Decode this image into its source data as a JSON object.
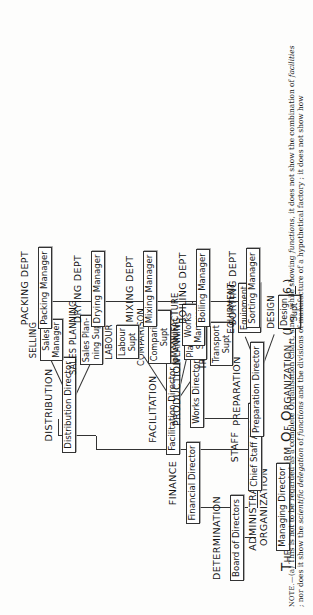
{
  "figure": {
    "title_main": "The Functional Form of Organization.",
    "title_ref": "(Figure 6.)"
  },
  "nodes": {
    "determination": {
      "function": "Determination",
      "role": "Board of Directors"
    },
    "administration": {
      "function": "Administration Organization",
      "function_line1": "Administration",
      "function_line2": "Organization",
      "role": "Managing Director"
    },
    "finance": {
      "function": "Finance",
      "role": "Financial Director"
    },
    "staff": {
      "function": "Staff",
      "role": "Chief Staff Adviser"
    },
    "facilitation": {
      "function": "Facilitation",
      "role": "Facilitation Director"
    },
    "distribution": {
      "function": "Distribution",
      "role": "Distribution Director"
    },
    "production": {
      "function": "Production",
      "role": "Works Director"
    },
    "preparation": {
      "function": "Preparation",
      "role": "Preparation Director"
    },
    "transport": {
      "function": "Transport",
      "role": "Transport Supt",
      "role_line1": "Transport",
      "role_line2": "Supt"
    },
    "planning": {
      "function": "Planning",
      "role": "Planning Supt",
      "role_line1": "Planning",
      "role_line2": "Supt"
    },
    "comparison": {
      "function": "Comparison",
      "role": "Comparison Supt",
      "role_line1": "Comparison",
      "role_line2": "Supt"
    },
    "labour": {
      "function": "Labour",
      "role": "Labour Supt",
      "role_line1": "Labour",
      "role_line2": "Supt"
    },
    "sales_planning": {
      "function": "Sales Planning",
      "role": "Sales Planning Supt",
      "role_line1": "Sales Plan-",
      "role_line2": "ning Supt"
    },
    "selling": {
      "function": "Selling",
      "role": "Sales Manager",
      "role_line1": "Sales",
      "role_line2": "Manager"
    },
    "design": {
      "function": "Design",
      "role": "Design Supt",
      "role_line1": "Design",
      "role_line2": "Supt"
    },
    "equipment": {
      "function": "Equipment",
      "role": "Equipment Supt",
      "role_line1": "Equipment",
      "role_line2": "Supt"
    },
    "manufacture": {
      "function": "Manufacture",
      "role": "Works Manager",
      "role_line1": "Works",
      "role_line2": "Manager"
    },
    "sorting_dept": {
      "function": "Sorting Dept",
      "role": "Sorting Manager"
    },
    "boiling_dept": {
      "function": "Boiling Dept",
      "role": "Boiling Manager"
    },
    "mixing_dept": {
      "function": "Mixing Dept",
      "role": "Mixing Manager"
    },
    "drying_dept": {
      "function": "Drying Dept",
      "role": "Drying Manager"
    },
    "packing_dept": {
      "function": "Packing Dept",
      "role": "Packing Manager"
    }
  },
  "note": {
    "label": "Note.—",
    "marker": "(a)",
    "text_part1": "This is not to be regarded as a complete Organisation Chart, since, while showing ",
    "text_italic1": "functions",
    "text_part2": ", it does not show the combination of ",
    "text_italic2": "facilities",
    "text_part3": " ; nor does it show the ",
    "text_italic3": "scientific",
    "text_part4": " ",
    "text_italic4": "delegation",
    "text_part5": " of ",
    "text_italic5": "functions",
    "text_part6": " and the divisions of manufacture of a hypothetical factory ; it does not show how"
  }
}
